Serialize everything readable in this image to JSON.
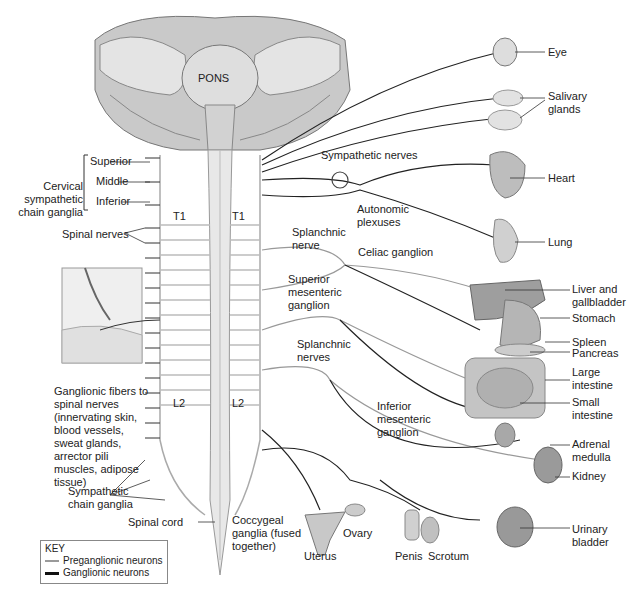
{
  "diagram": {
    "brain": {
      "pons_label": "PONS"
    },
    "left_labels": {
      "cervical_group": "Cervical sympathetic chain ganglia",
      "cervical_items": [
        "Superior",
        "Middle",
        "Inferior"
      ],
      "spinal_nerves": "Spinal nerves",
      "ganglionic_fibers": "Ganglionic fibers to spinal nerves (innervating skin, blood vessels, sweat glands, arrector pili muscles, adipose tissue)",
      "sympathetic_chain_ganglia": "Sympathetic chain ganglia",
      "spinal_cord": "Spinal cord"
    },
    "segment_labels": {
      "t1_left": "T1",
      "t1_right": "T1",
      "l2_left": "L2",
      "l2_right": "L2"
    },
    "center_labels": {
      "sympathetic_nerves": "Sympathetic nerves",
      "autonomic_plexuses": "Autonomic plexuses",
      "splanchnic_nerve": "Splanchnic nerve",
      "celiac_ganglion": "Celiac ganglion",
      "superior_mesenteric_ganglion": "Superior mesenteric ganglion",
      "splanchnic_nerves": "Splanchnic nerves",
      "inferior_mesenteric_ganglion": "Inferior mesenteric ganglion",
      "coccygeal_ganglia": "Coccygeal ganglia (fused together)"
    },
    "organs": [
      {
        "id": "eye",
        "label": "Eye"
      },
      {
        "id": "salivary",
        "label": "Salivary glands"
      },
      {
        "id": "heart",
        "label": "Heart"
      },
      {
        "id": "lung",
        "label": "Lung"
      },
      {
        "id": "liver",
        "label": "Liver and gallbladder"
      },
      {
        "id": "stomach",
        "label": "Stomach"
      },
      {
        "id": "spleen",
        "label": "Spleen"
      },
      {
        "id": "pancreas",
        "label": "Pancreas"
      },
      {
        "id": "large_intestine",
        "label": "Large intestine"
      },
      {
        "id": "small_intestine",
        "label": "Small intestine"
      },
      {
        "id": "adrenal",
        "label": "Adrenal medulla"
      },
      {
        "id": "kidney",
        "label": "Kidney"
      },
      {
        "id": "bladder",
        "label": "Urinary bladder"
      },
      {
        "id": "uterus",
        "label": "Uterus"
      },
      {
        "id": "ovary",
        "label": "Ovary"
      },
      {
        "id": "penis",
        "label": "Penis"
      },
      {
        "id": "scrotum",
        "label": "Scrotum"
      }
    ],
    "key": {
      "title": "KEY",
      "items": [
        {
          "label": "Preganglionic neurons",
          "color": "#9a9a9a"
        },
        {
          "label": "Ganglionic neurons",
          "color": "#111111"
        }
      ]
    }
  }
}
